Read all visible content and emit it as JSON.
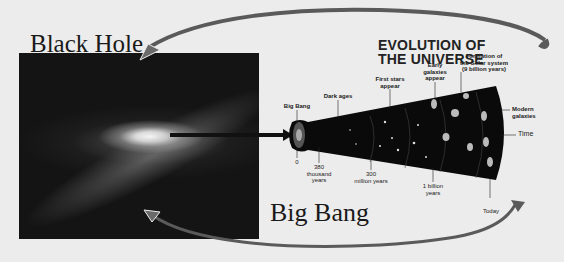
{
  "left_panel": {
    "title": "Black Hole",
    "image": "spiral-galaxy-photo"
  },
  "bottom_label": "Big Bang",
  "diagram": {
    "title_line1": "EVOLUTION OF",
    "title_line2": "THE UNIVERSE",
    "top_labels": [
      {
        "line1": "Big Bang",
        "line2": ""
      },
      {
        "line1": "Dark ages",
        "line2": ""
      },
      {
        "line1": "First stars",
        "line2": "appear"
      },
      {
        "line1": "Early",
        "line2": "galaxies",
        "line3": "appear"
      },
      {
        "line1": "Formation of",
        "line2": "the Solar system",
        "line3": "(9 billion years)"
      }
    ],
    "right_labels": [
      {
        "line1": "Modern",
        "line2": "galaxies"
      },
      {
        "line1": "Time"
      }
    ],
    "bottom_labels": [
      {
        "line1": "0"
      },
      {
        "line1": "380",
        "line2": "thousand",
        "line3": "years"
      },
      {
        "line1": "300",
        "line2": "million years"
      },
      {
        "line1": "1 billion",
        "line2": "years"
      },
      {
        "line1": "Today"
      }
    ]
  },
  "colors": {
    "background": "#ececec",
    "arrow": "#555555",
    "cone": "#0a0a0a"
  }
}
